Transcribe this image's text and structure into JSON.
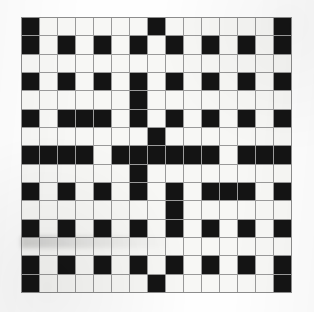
{
  "document": {
    "kind": "crossword-puzzle-grid",
    "title": "Crossword Grid",
    "rows": 15,
    "columns": 15,
    "colors": {
      "block": "#141414",
      "light": "#f7f7f5",
      "gridline": "#9a9a9a",
      "paper": "#fefefe"
    }
  },
  "grid": {
    "legend": {
      "black": "blocked square",
      "white": "open letter square"
    },
    "cells": [
      [
        "black",
        "white",
        "white",
        "white",
        "white",
        "white",
        "white",
        "black",
        "white",
        "white",
        "white",
        "white",
        "white",
        "white",
        "black"
      ],
      [
        "black",
        "white",
        "black",
        "white",
        "black",
        "white",
        "black",
        "white",
        "black",
        "white",
        "black",
        "white",
        "black",
        "white",
        "black"
      ],
      [
        "white",
        "white",
        "white",
        "white",
        "white",
        "white",
        "white",
        "white",
        "white",
        "white",
        "white",
        "white",
        "white",
        "white",
        "white"
      ],
      [
        "black",
        "white",
        "black",
        "white",
        "black",
        "white",
        "black",
        "white",
        "black",
        "white",
        "black",
        "white",
        "black",
        "white",
        "black"
      ],
      [
        "white",
        "white",
        "white",
        "white",
        "white",
        "white",
        "black",
        "white",
        "white",
        "white",
        "white",
        "white",
        "white",
        "white",
        "white"
      ],
      [
        "black",
        "white",
        "black",
        "black",
        "black",
        "white",
        "black",
        "white",
        "black",
        "white",
        "black",
        "white",
        "black",
        "white",
        "black"
      ],
      [
        "white",
        "white",
        "white",
        "white",
        "white",
        "white",
        "white",
        "black",
        "white",
        "white",
        "white",
        "white",
        "white",
        "white",
        "white"
      ],
      [
        "black",
        "black",
        "black",
        "black",
        "white",
        "black",
        "black",
        "black",
        "black",
        "black",
        "black",
        "white",
        "black",
        "black",
        "black"
      ],
      [
        "white",
        "white",
        "white",
        "white",
        "white",
        "white",
        "black",
        "white",
        "white",
        "white",
        "white",
        "white",
        "white",
        "white",
        "white"
      ],
      [
        "black",
        "white",
        "black",
        "white",
        "black",
        "white",
        "black",
        "white",
        "black",
        "white",
        "black",
        "black",
        "black",
        "white",
        "black"
      ],
      [
        "white",
        "white",
        "white",
        "white",
        "white",
        "white",
        "white",
        "white",
        "black",
        "white",
        "white",
        "white",
        "white",
        "white",
        "white"
      ],
      [
        "black",
        "white",
        "black",
        "white",
        "black",
        "white",
        "black",
        "white",
        "black",
        "white",
        "black",
        "white",
        "black",
        "white",
        "black"
      ],
      [
        "white",
        "white",
        "white",
        "white",
        "white",
        "white",
        "white",
        "white",
        "white",
        "white",
        "white",
        "white",
        "white",
        "white",
        "white"
      ],
      [
        "black",
        "white",
        "black",
        "white",
        "black",
        "white",
        "black",
        "white",
        "black",
        "white",
        "black",
        "white",
        "black",
        "white",
        "black"
      ],
      [
        "black",
        "white",
        "white",
        "white",
        "white",
        "white",
        "white",
        "black",
        "white",
        "white",
        "white",
        "white",
        "white",
        "white",
        "black"
      ]
    ]
  }
}
